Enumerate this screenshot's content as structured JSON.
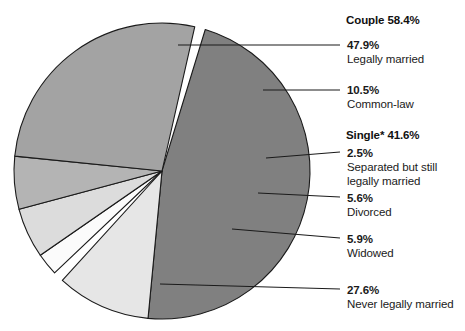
{
  "chart_data": {
    "type": "pie",
    "title": "",
    "subtitle": "",
    "xlabel": "",
    "ylabel": "",
    "legend_position": "right-callouts",
    "grid": false,
    "units": "percent",
    "total": 100,
    "groups": [
      {
        "name": "Couple",
        "label": "Couple 58.4%",
        "value": 58.4,
        "members": [
          "Legally married",
          "Common-law"
        ]
      },
      {
        "name": "Single*",
        "label": "Single* 41.6%",
        "value": 41.6,
        "members": [
          "Separated but still legally married",
          "Divorced",
          "Widowed",
          "Never legally married"
        ]
      }
    ],
    "categories": [
      "Legally married",
      "Common-law",
      "Separated but still legally married",
      "Divorced",
      "Widowed",
      "Never legally married"
    ],
    "values": [
      47.9,
      10.5,
      2.5,
      5.6,
      5.9,
      27.6
    ],
    "colors": [
      "#808080",
      "#e6e6e6",
      "#fbfbfb",
      "#dcdcdc",
      "#b4b4b4",
      "#a3a3a3"
    ],
    "slices": [
      {
        "pct_label": "47.9%",
        "desc_line1": "Legally married",
        "desc_line2": "",
        "value": 47.9,
        "color": "#808080",
        "group": "Couple"
      },
      {
        "pct_label": "10.5%",
        "desc_line1": "Common-law",
        "desc_line2": "",
        "value": 10.5,
        "color": "#e6e6e6",
        "group": "Couple"
      },
      {
        "pct_label": "2.5%",
        "desc_line1": "Separated but still",
        "desc_line2": "legally married",
        "value": 2.5,
        "color": "#fbfbfb",
        "group": "Single*"
      },
      {
        "pct_label": "5.6%",
        "desc_line1": "Divorced",
        "desc_line2": "",
        "value": 5.6,
        "color": "#dcdcdc",
        "group": "Single*"
      },
      {
        "pct_label": "5.9%",
        "desc_line1": "Widowed",
        "desc_line2": "",
        "value": 5.9,
        "color": "#b4b4b4",
        "group": "Single*"
      },
      {
        "pct_label": "27.6%",
        "desc_line1": "Never legally married",
        "desc_line2": "",
        "value": 27.6,
        "color": "#a3a3a3",
        "group": "Single*"
      }
    ]
  },
  "headings": {
    "couple": "Couple 58.4%",
    "single": "Single* 41.6%"
  },
  "labels": {
    "legally_married": {
      "pct": "47.9%",
      "l1": "Legally married",
      "l2": ""
    },
    "common_law": {
      "pct": "10.5%",
      "l1": "Common-law",
      "l2": ""
    },
    "separated": {
      "pct": "2.5%",
      "l1": "Separated but still",
      "l2": "legally married"
    },
    "divorced": {
      "pct": "5.6%",
      "l1": "Divorced",
      "l2": ""
    },
    "widowed": {
      "pct": "5.9%",
      "l1": "Widowed",
      "l2": ""
    },
    "never_married": {
      "pct": "27.6%",
      "l1": "Never legally married",
      "l2": ""
    }
  },
  "style": {
    "stroke": "#1a1a1a",
    "background": "#ffffff",
    "text": "#1a1a1a"
  }
}
